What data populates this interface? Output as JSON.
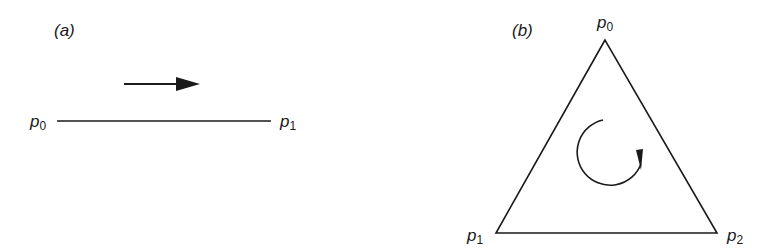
{
  "panel_a": {
    "label": "(a)",
    "points": [
      {
        "name": "p",
        "sub": "0"
      },
      {
        "name": "p",
        "sub": "1"
      }
    ],
    "arrow_direction": "right"
  },
  "panel_b": {
    "label": "(b)",
    "points": [
      {
        "name": "p",
        "sub": "0"
      },
      {
        "name": "p",
        "sub": "1"
      },
      {
        "name": "p",
        "sub": "2"
      }
    ],
    "rotation": "counterclockwise"
  },
  "colors": {
    "stroke": "#1a1a1a",
    "background": "#ffffff"
  }
}
